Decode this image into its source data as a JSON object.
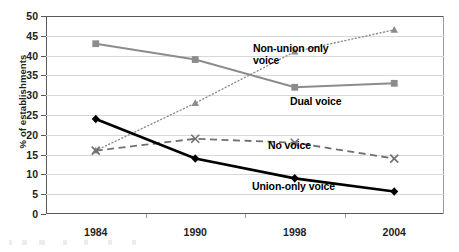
{
  "chart_data": {
    "type": "line",
    "title": "",
    "xlabel": "",
    "ylabel": "% of establishments",
    "categories": [
      "1984",
      "1990",
      "1998",
      "2004"
    ],
    "x": [
      1984,
      1990,
      1998,
      2004
    ],
    "ylim": [
      0,
      50
    ],
    "yticks": [
      0,
      5,
      10,
      15,
      20,
      25,
      30,
      35,
      40,
      45,
      50
    ],
    "grid": true,
    "legend_position": "inline-right-of-lines",
    "series": [
      {
        "name": "Dual voice",
        "label": "Dual voice",
        "values": [
          43,
          39,
          32,
          33
        ],
        "color": "#8c8c8e",
        "marker": "square",
        "linestyle": "solid",
        "linewidth": 2
      },
      {
        "name": "Non-union only voice",
        "label": "Non-union only\nvoice",
        "values": [
          16,
          28,
          41,
          46.5
        ],
        "color": "#8c8c8e",
        "marker": "triangle",
        "linestyle": "dotted",
        "linewidth": 1.4
      },
      {
        "name": "No voice",
        "label": "No voice",
        "values": [
          16,
          19,
          18,
          14
        ],
        "color": "#6f7072",
        "marker": "x",
        "linestyle": "dashed",
        "linewidth": 1.8
      },
      {
        "name": "Union-only voice",
        "label": "Union-only voice",
        "values": [
          24,
          14,
          9,
          5.7
        ],
        "color": "#000000",
        "marker": "diamond",
        "linestyle": "solid",
        "linewidth": 2.6
      }
    ]
  },
  "axis": {
    "y_tick_labels": [
      "50",
      "45",
      "40",
      "35",
      "30",
      "25",
      "20",
      "15",
      "10",
      "5",
      "0"
    ],
    "y_title": "% of establishments",
    "x_tick_labels": [
      "1984",
      "1990",
      "1998",
      "2004"
    ]
  },
  "labels": {
    "nonunion": "Non-union only\nvoice",
    "dual": "Dual voice",
    "novoice": "No voice",
    "union": "Union-only voice"
  }
}
